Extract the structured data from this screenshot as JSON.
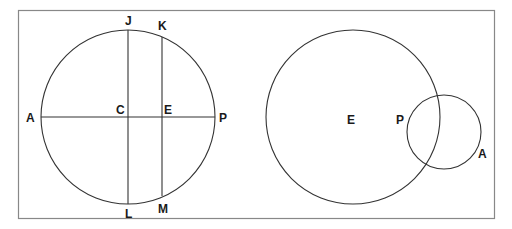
{
  "figure": {
    "left_panel": {
      "labels": {
        "J": "J",
        "K": "K",
        "A": "A",
        "C": "C",
        "E": "E",
        "P": "P",
        "L": "L",
        "M": "M"
      }
    },
    "right_panel": {
      "labels": {
        "E": "E",
        "P": "P",
        "A": "A"
      }
    }
  },
  "colors": {
    "stroke": "#333333",
    "frame": "#888888",
    "background": "#ffffff"
  }
}
